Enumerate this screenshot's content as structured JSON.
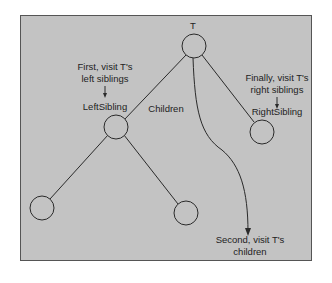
{
  "diagram": {
    "colors": {
      "background": "#c3c3c3",
      "border": "#555555",
      "stroke": "#2a2a2a",
      "text": "#222222"
    },
    "nodes": {
      "root": {
        "label": "T"
      },
      "left_sibling": {
        "label": "LeftSibling"
      },
      "right_sibling": {
        "label": "RightSibling"
      }
    },
    "edges": {
      "children": {
        "label": "Children"
      }
    },
    "annotations": {
      "first": {
        "line1": "First, visit T's",
        "line2": "left siblings"
      },
      "finally": {
        "line1": "Finally, visit T's",
        "line2": "right siblings"
      },
      "second": {
        "line1": "Second, visit T's",
        "line2": "children"
      }
    }
  }
}
